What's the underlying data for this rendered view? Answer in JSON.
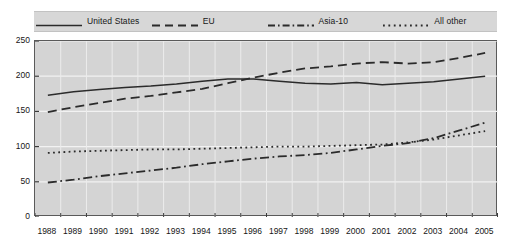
{
  "chart_data": {
    "type": "line",
    "title": "",
    "xlabel": "",
    "ylabel": "",
    "ylim": [
      0,
      250
    ],
    "yticks": [
      0,
      50,
      100,
      150,
      200,
      250
    ],
    "grid": true,
    "legend_position": "top",
    "categories": [
      "1988",
      "1989",
      "1990",
      "1991",
      "1992",
      "1993",
      "1994",
      "1995",
      "1996",
      "1997",
      "1998",
      "1999",
      "2000",
      "2001",
      "2002",
      "2003",
      "2004",
      "2005"
    ],
    "series": [
      {
        "name": "United States",
        "style": "solid",
        "color": "#2b2b2b",
        "values": [
          173,
          178,
          181,
          184,
          186,
          189,
          193,
          196,
          196,
          193,
          190,
          189,
          191,
          188,
          190,
          192,
          196,
          200
        ]
      },
      {
        "name": "EU",
        "style": "dashed",
        "color": "#2b2b2b",
        "values": [
          149,
          156,
          162,
          168,
          172,
          177,
          182,
          190,
          198,
          205,
          211,
          214,
          218,
          220,
          218,
          220,
          226,
          233
        ]
      },
      {
        "name": "Asia-10",
        "style": "dash-dot",
        "color": "#2b2b2b",
        "values": [
          49,
          53,
          58,
          62,
          66,
          70,
          75,
          79,
          83,
          86,
          88,
          91,
          96,
          101,
          105,
          112,
          123,
          134
        ]
      },
      {
        "name": "All other",
        "style": "dotted",
        "color": "#2b2b2b",
        "values": [
          91,
          93,
          94,
          95,
          96,
          96,
          97,
          98,
          99,
          100,
          100,
          101,
          102,
          103,
          106,
          110,
          116,
          122
        ]
      }
    ]
  },
  "legend": {
    "items": [
      {
        "label": "United States",
        "style": "solid"
      },
      {
        "label": "EU",
        "style": "dashed"
      },
      {
        "label": "Asia-10",
        "style": "dash-dot"
      },
      {
        "label": "All other",
        "style": "dotted"
      }
    ]
  }
}
